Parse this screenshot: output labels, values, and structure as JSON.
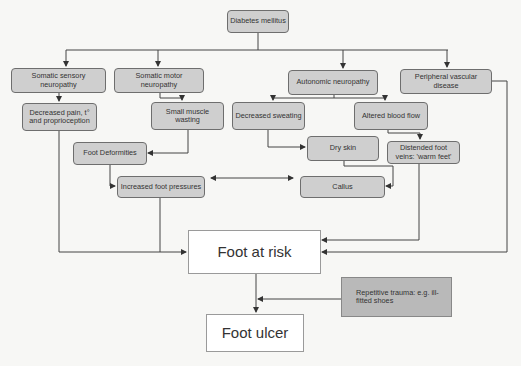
{
  "diagram": {
    "nodes": {
      "diabetes": "Diabetes mellitus",
      "sensory": "Somatic sensory neuropathy",
      "motor": "Somatic motor neuropathy",
      "autonomic": "Autonomic neuropathy",
      "vascular": "Peripheral vascular disease",
      "decreased_pain": "Decreased pain, t° and proprioception",
      "muscle_wasting": "Small muscle wasting",
      "decreased_sweating": "Decreased sweating",
      "altered_blood_flow": "Altered blood flow",
      "foot_deformities": "Foot Deformities",
      "dry_skin": "Dry skin",
      "distended_veins": "Distended foot veins: 'warm feet'",
      "increased_pressures": "Increased foot pressures",
      "callus": "Callus",
      "foot_at_risk": "Foot at risk",
      "repetitive_trauma": "Repetitive trauma: e.g. ill-fitted shoes",
      "foot_ulcer": "Foot ulcer"
    },
    "edges": [
      [
        "diabetes",
        "sensory"
      ],
      [
        "diabetes",
        "motor"
      ],
      [
        "diabetes",
        "autonomic"
      ],
      [
        "diabetes",
        "vascular"
      ],
      [
        "sensory",
        "decreased_pain"
      ],
      [
        "motor",
        "muscle_wasting"
      ],
      [
        "autonomic",
        "decreased_sweating"
      ],
      [
        "autonomic",
        "altered_blood_flow"
      ],
      [
        "muscle_wasting",
        "foot_deformities"
      ],
      [
        "decreased_sweating",
        "dry_skin"
      ],
      [
        "altered_blood_flow",
        "distended_veins"
      ],
      [
        "foot_deformities",
        "increased_pressures"
      ],
      [
        "dry_skin",
        "callus"
      ],
      [
        "increased_pressures",
        "callus",
        "bidirectional"
      ],
      [
        "decreased_pain",
        "foot_at_risk"
      ],
      [
        "increased_pressures",
        "foot_at_risk"
      ],
      [
        "distended_veins",
        "foot_at_risk"
      ],
      [
        "vascular",
        "foot_at_risk"
      ],
      [
        "foot_at_risk",
        "foot_ulcer"
      ],
      [
        "repetitive_trauma",
        "foot_ulcer"
      ]
    ],
    "colors": {
      "box_fill": "#cfcfcf",
      "box_border": "#6e6e6e",
      "line": "#444444",
      "outcome_fill": "#ffffff",
      "trauma_fill": "#b9b9b9"
    }
  }
}
